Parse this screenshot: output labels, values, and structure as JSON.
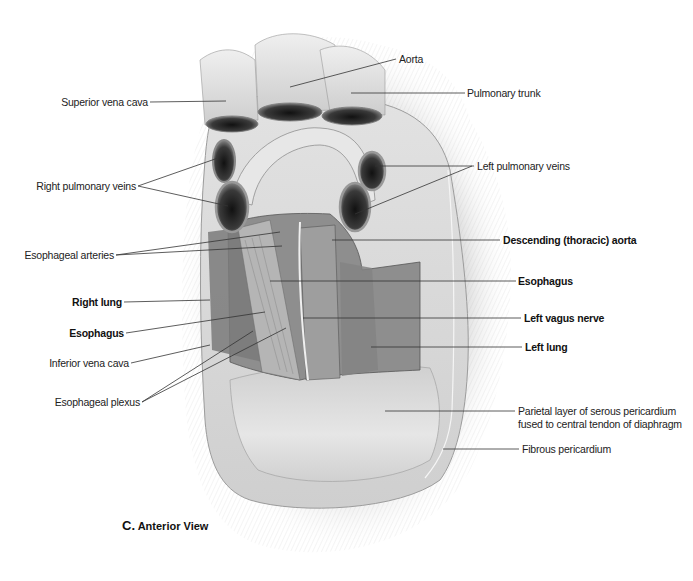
{
  "figure": {
    "caption_letter": "C.",
    "caption_text": "Anterior View"
  },
  "labels": {
    "left": [
      {
        "id": "superior-vena-cava",
        "text": "Superior vena cava",
        "bold": false
      },
      {
        "id": "right-pulmonary-veins",
        "text": "Right pulmonary veins",
        "bold": false
      },
      {
        "id": "esophageal-arteries",
        "text": "Esophageal arteries",
        "bold": false
      },
      {
        "id": "right-lung",
        "text": "Right lung",
        "bold": true
      },
      {
        "id": "esophagus-left",
        "text": "Esophagus",
        "bold": true
      },
      {
        "id": "inferior-vena-cava",
        "text": "Inferior vena cava",
        "bold": false
      },
      {
        "id": "esophageal-plexus",
        "text": "Esophageal plexus",
        "bold": false
      }
    ],
    "right": [
      {
        "id": "aorta",
        "text": "Aorta",
        "bold": false
      },
      {
        "id": "pulmonary-trunk",
        "text": "Pulmonary trunk",
        "bold": false
      },
      {
        "id": "left-pulmonary-veins",
        "text": "Left pulmonary veins",
        "bold": false
      },
      {
        "id": "descending-aorta",
        "text": "Descending (thoracic) aorta",
        "bold": true
      },
      {
        "id": "esophagus-right",
        "text": "Esophagus",
        "bold": true
      },
      {
        "id": "left-vagus-nerve",
        "text": "Left vagus nerve",
        "bold": true
      },
      {
        "id": "left-lung",
        "text": "Left lung",
        "bold": true
      },
      {
        "id": "parietal-layer-1",
        "text": "Parietal layer of serous pericardium",
        "bold": false
      },
      {
        "id": "parietal-layer-2",
        "text": "fused to central tendon of diaphragm",
        "bold": false
      },
      {
        "id": "fibrous-pericardium",
        "text": "Fibrous pericardium",
        "bold": false
      }
    ]
  },
  "colors": {
    "background": "#ffffff",
    "label_text": "#222222",
    "leader_line": "#333333",
    "pericardium_light": "#e8e8e8",
    "pericardium_mid": "#c9c9c9",
    "tissue_dark": "#6a6a6a",
    "vessel_lumen": "#2a2a2a"
  }
}
